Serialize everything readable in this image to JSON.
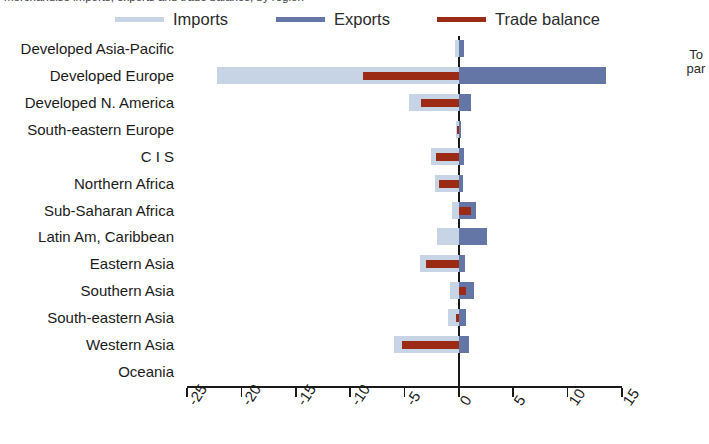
{
  "caption": {
    "clipped_top_text": "merchandise imports, exports and trade balance, by region"
  },
  "legend": {
    "items": [
      {
        "label": "Imports",
        "color": "#c7d4e6",
        "name": "imports"
      },
      {
        "label": "Exports",
        "color": "#6476a6",
        "name": "exports"
      },
      {
        "label": "Trade balance",
        "color": "#9c2b16",
        "name": "trade-balance"
      }
    ]
  },
  "right_annotation": {
    "line1": "To",
    "line2": "par"
  },
  "chart_data": {
    "type": "bar",
    "orientation": "horizontal",
    "title": "",
    "xlabel": "",
    "ylabel": "",
    "xlim": [
      -25,
      15
    ],
    "xticks": [
      -25,
      -20,
      -15,
      -10,
      -5,
      0,
      5,
      10,
      15
    ],
    "xtick_labels": [
      "-25",
      "-20",
      "-15",
      "-10",
      "-5",
      "0",
      "5",
      "10",
      "15"
    ],
    "grid": false,
    "legend_position": "top",
    "categories": [
      "Developed Asia-Pacific",
      "Developed Europe",
      "Developed N. America",
      "South-eastern Europe",
      "C I S",
      "Northern Africa",
      "Sub-Saharan Africa",
      "Latin Am, Caribbean",
      "Eastern Asia",
      "Southern Asia",
      "South-eastern Asia",
      "Western Asia",
      "Oceania"
    ],
    "series": [
      {
        "name": "Imports",
        "color": "#c7d4e6",
        "values": [
          -0.4,
          -22.2,
          -4.6,
          -0.3,
          -2.6,
          -2.2,
          -0.6,
          -2.0,
          -3.6,
          -0.8,
          -1.0,
          -6.0,
          0.0
        ]
      },
      {
        "name": "Exports",
        "color": "#6476a6",
        "values": [
          0.5,
          13.5,
          1.1,
          0.2,
          0.5,
          0.4,
          1.6,
          2.6,
          0.6,
          1.4,
          0.7,
          0.9,
          0.0
        ]
      },
      {
        "name": "Trade balance",
        "color": "#9c2b16",
        "values": [
          0.0,
          -8.8,
          -3.5,
          -0.2,
          -2.1,
          -1.8,
          1.1,
          0.0,
          -3.0,
          0.7,
          -0.3,
          -5.2,
          0.0
        ]
      }
    ]
  }
}
